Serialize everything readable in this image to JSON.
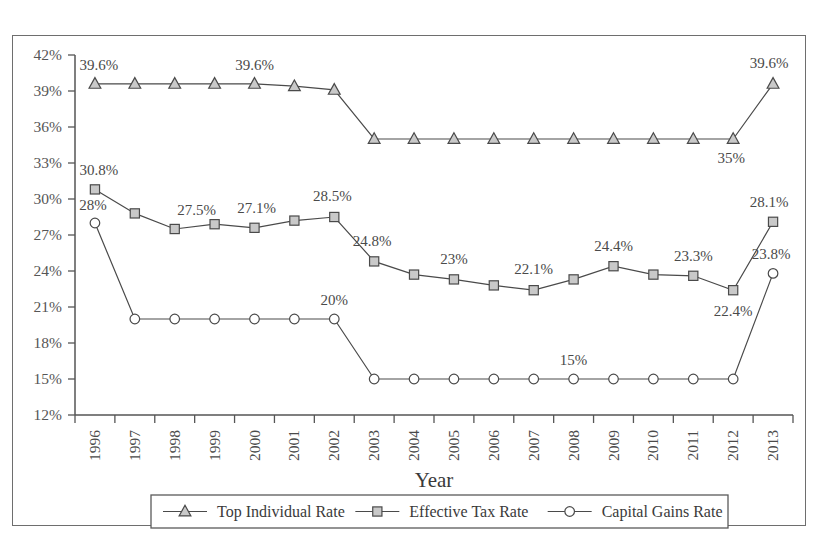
{
  "page": {
    "top_partial_text": "",
    "background": "#ffffff",
    "frame_color": "#6e6e6e"
  },
  "chart_data": {
    "type": "line",
    "title": "",
    "xlabel": "Year",
    "ylabel": "",
    "grid": false,
    "legend_position": "bottom",
    "categories": [
      "1996",
      "1997",
      "1998",
      "1999",
      "2000",
      "2001",
      "2002",
      "2003",
      "2004",
      "2005",
      "2006",
      "2007",
      "2008",
      "2009",
      "2010",
      "2011",
      "2012",
      "2013"
    ],
    "ylim": [
      12,
      42
    ],
    "yticks": [
      12,
      15,
      18,
      21,
      24,
      27,
      30,
      33,
      36,
      39,
      42
    ],
    "ytick_labels": [
      "12%",
      "15%",
      "18%",
      "21%",
      "24%",
      "27%",
      "30%",
      "33%",
      "36%",
      "39%",
      "42%"
    ],
    "series": [
      {
        "name": "Top Individual Rate",
        "marker": "triangle",
        "color": "#4a4a4a",
        "marker_fill": "#c9c9c9",
        "values": [
          39.6,
          39.6,
          39.6,
          39.6,
          39.6,
          39.4,
          39.1,
          35.0,
          35.0,
          35.0,
          35.0,
          35.0,
          35.0,
          35.0,
          35.0,
          35.0,
          35.0,
          39.6
        ]
      },
      {
        "name": "Effective Tax Rate",
        "marker": "square",
        "color": "#4a4a4a",
        "marker_fill": "#c9c9c9",
        "values": [
          30.8,
          28.8,
          27.5,
          27.9,
          27.6,
          28.2,
          28.5,
          24.8,
          23.7,
          23.3,
          22.8,
          22.4,
          23.3,
          24.4,
          23.7,
          23.6,
          22.4,
          28.1
        ]
      },
      {
        "name": "Capital Gains Rate",
        "marker": "circle",
        "color": "#4a4a4a",
        "marker_fill": "#ffffff",
        "values": [
          28.0,
          20.0,
          20.0,
          20.0,
          20.0,
          20.0,
          20.0,
          15.0,
          15.0,
          15.0,
          15.0,
          15.0,
          15.0,
          15.0,
          15.0,
          15.0,
          15.0,
          23.8
        ]
      }
    ],
    "annotations": [
      {
        "text": "39.6%",
        "series": "Top Individual Rate",
        "category": "1996",
        "dx": 4,
        "dy": -14
      },
      {
        "text": "39.6%",
        "series": "Top Individual Rate",
        "category": "2000",
        "dx": 0,
        "dy": -14
      },
      {
        "text": "35%",
        "series": "Top Individual Rate",
        "category": "2012",
        "dx": -2,
        "dy": 24
      },
      {
        "text": "39.6%",
        "series": "Top Individual Rate",
        "category": "2013",
        "dx": -4,
        "dy": -16
      },
      {
        "text": "30.8%",
        "series": "Effective Tax Rate",
        "category": "1996",
        "dx": 4,
        "dy": -14
      },
      {
        "text": "27.5%",
        "series": "Effective Tax Rate",
        "category": "1998",
        "dx": 22,
        "dy": -14
      },
      {
        "text": "27.1%",
        "series": "Effective Tax Rate",
        "category": "2000",
        "dx": 2,
        "dy": -15
      },
      {
        "text": "28.5%",
        "series": "Effective Tax Rate",
        "category": "2002",
        "dx": -2,
        "dy": -16
      },
      {
        "text": "24.8%",
        "series": "Effective Tax Rate",
        "category": "2003",
        "dx": -2,
        "dy": -15
      },
      {
        "text": "23%",
        "series": "Effective Tax Rate",
        "category": "2005",
        "dx": 0,
        "dy": -15
      },
      {
        "text": "22.1%",
        "series": "Effective Tax Rate",
        "category": "2007",
        "dx": 0,
        "dy": -16
      },
      {
        "text": "24.4%",
        "series": "Effective Tax Rate",
        "category": "2009",
        "dx": 0,
        "dy": -15
      },
      {
        "text": "23.3%",
        "series": "Effective Tax Rate",
        "category": "2011",
        "dx": 0,
        "dy": -15
      },
      {
        "text": "22.4%",
        "series": "Effective Tax Rate",
        "category": "2012",
        "dx": 0,
        "dy": 26
      },
      {
        "text": "28.1%",
        "series": "Effective Tax Rate",
        "category": "2013",
        "dx": -4,
        "dy": -15
      },
      {
        "text": "28%",
        "series": "Capital Gains Rate",
        "category": "1996",
        "dx": -2,
        "dy": -13
      },
      {
        "text": "20%",
        "series": "Capital Gains Rate",
        "category": "2002",
        "dx": 0,
        "dy": -14
      },
      {
        "text": "15%",
        "series": "Capital Gains Rate",
        "category": "2008",
        "dx": 0,
        "dy": -14
      },
      {
        "text": "23.8%",
        "series": "Capital Gains Rate",
        "category": "2013",
        "dx": -2,
        "dy": -14
      }
    ]
  },
  "legend": {
    "items": [
      {
        "label": "Top Individual Rate",
        "marker": "triangle"
      },
      {
        "label": "Effective Tax Rate",
        "marker": "square"
      },
      {
        "label": "Capital Gains Rate",
        "marker": "circle"
      }
    ]
  }
}
